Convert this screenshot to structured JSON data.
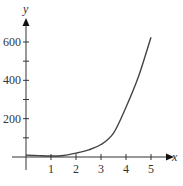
{
  "chart_data": {
    "type": "line",
    "title": "",
    "xlabel": "x",
    "ylabel": "y",
    "xlim": [
      0,
      5.6
    ],
    "ylim": [
      0,
      720
    ],
    "grid": false,
    "legend": null,
    "x_ticks": [
      1,
      2,
      3,
      4,
      5
    ],
    "x_tick_labels": [
      "1",
      "2",
      "3",
      "4",
      "5"
    ],
    "y_ticks": [
      100,
      200,
      300,
      400,
      500,
      600
    ],
    "y_tick_labels": [
      "",
      "200",
      "",
      "400",
      "",
      "600"
    ],
    "series": [
      {
        "name": "curve",
        "color": "#444444",
        "x": [
          0,
          0.5,
          1,
          1.5,
          2,
          2.5,
          3,
          3.5,
          4,
          4.5,
          5
        ],
        "y": [
          10,
          7,
          5,
          8,
          20,
          37,
          65,
          125,
          260,
          420,
          625
        ]
      }
    ]
  },
  "axes": {
    "x_label": "x",
    "y_label": "y"
  }
}
